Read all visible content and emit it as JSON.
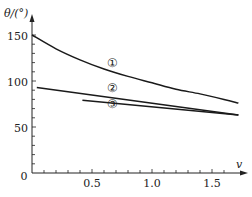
{
  "chart_data": {
    "type": "line",
    "title": "",
    "xlabel": "v",
    "ylabel": "θ/(°)",
    "xlim": [
      0,
      1.7
    ],
    "ylim": [
      0,
      160
    ],
    "grid": false,
    "legend": "inline circled-number labels",
    "x_ticks": [
      0.5,
      1.0,
      1.5
    ],
    "x_tick_labels": [
      "0.5",
      "1.0",
      "1.5"
    ],
    "y_ticks": [
      50,
      100,
      150
    ],
    "y_tick_labels": [
      "50",
      "100",
      "150"
    ],
    "origin_label": "0",
    "series": [
      {
        "name": "①",
        "x": [
          0.0,
          0.2,
          0.4,
          0.6,
          0.8,
          1.0,
          1.2,
          1.4,
          1.6,
          1.72
        ],
        "values": [
          150,
          135,
          123,
          113,
          105,
          98,
          91,
          86,
          80,
          76
        ]
      },
      {
        "name": "②",
        "x": [
          0.04,
          1.72
        ],
        "values": [
          93,
          63
        ]
      },
      {
        "name": "③",
        "x": [
          0.42,
          1.72
        ],
        "values": [
          79,
          63
        ]
      }
    ],
    "annotations": [
      {
        "text": "①",
        "x": 0.72,
        "y": 114
      },
      {
        "text": "②",
        "x": 0.72,
        "y": 86
      },
      {
        "text": "③",
        "x": 0.72,
        "y": 71
      }
    ]
  },
  "labels": {
    "y_axis": "θ/(°)",
    "x_axis": "v",
    "origin": "0",
    "y150": "150",
    "y100": "100",
    "y50": "50",
    "x05": "0.5",
    "x10": "1.0",
    "x15": "1.5",
    "c1": "①",
    "c2": "②",
    "c3": "③"
  }
}
